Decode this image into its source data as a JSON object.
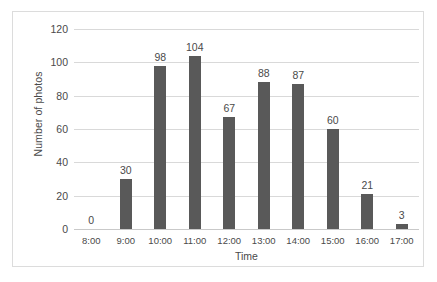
{
  "chart_data": {
    "type": "bar",
    "title": "",
    "xlabel": "Time",
    "ylabel": "Number of photos",
    "categories": [
      "8:00",
      "9:00",
      "10:00",
      "11:00",
      "12:00",
      "13:00",
      "14:00",
      "15:00",
      "16:00",
      "17:00"
    ],
    "values": [
      0,
      30,
      98,
      104,
      67,
      88,
      87,
      60,
      21,
      3
    ],
    "data_labels": [
      "0",
      "30",
      "98",
      "104",
      "67",
      "88",
      "87",
      "60",
      "21",
      "3"
    ],
    "ylim": [
      0,
      120
    ],
    "ytick_labels": [
      "0",
      "20",
      "40",
      "60",
      "80",
      "100",
      "120"
    ],
    "ytick_values": [
      0,
      20,
      40,
      60,
      80,
      100,
      120
    ],
    "grid": true,
    "legend": false,
    "bar_color": "#595959",
    "gridline_color": "#d9d9d9",
    "text_color": "#4a4a4a",
    "border_color": "#dcdcdc",
    "background_color": "#ffffff"
  }
}
